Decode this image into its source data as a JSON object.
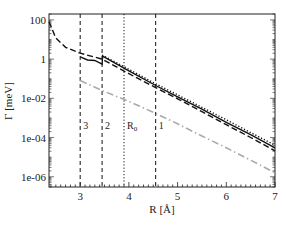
{
  "chart_data": {
    "type": "line",
    "title": "",
    "xlabel": "R [Å]",
    "ylabel": "Γ [meV]",
    "xscale": "linear",
    "yscale": "log",
    "xlim": [
      2.36,
      7.0
    ],
    "ylim": [
      3e-07,
      200
    ],
    "x_ticks": [
      3,
      4,
      5,
      6,
      7
    ],
    "x_tick_labels": [
      "3",
      "4",
      "5",
      "6",
      "7"
    ],
    "y_ticks": [
      100,
      1,
      0.01,
      0.0001,
      1e-06
    ],
    "y_tick_labels": [
      "100",
      "1",
      "1e-02",
      "1e-04",
      "1e-06"
    ],
    "grid": false,
    "legend": null,
    "vertical_markers": [
      {
        "label": "3",
        "x": 3.0,
        "style": "dashed"
      },
      {
        "label": "2",
        "x": 3.45,
        "style": "dashed"
      },
      {
        "label": "R0",
        "label_main": "R",
        "label_sub": "0",
        "x": 3.9,
        "style": "dotted"
      },
      {
        "label": "1",
        "x": 4.55,
        "style": "dashed"
      }
    ],
    "series": [
      {
        "name": "long-dashed (black)",
        "style": "dashed",
        "color": "#111111",
        "x": [
          2.36,
          2.5,
          2.7,
          3.0,
          3.45,
          4.0,
          4.55,
          5.0,
          5.5,
          6.0,
          6.5,
          7.0
        ],
        "y": [
          80,
          12,
          4.0,
          2.0,
          1.0,
          0.18,
          0.035,
          0.0095,
          0.0021,
          0.00045,
          0.0001,
          2.1e-05
        ]
      },
      {
        "name": "solid (black)",
        "style": "solid",
        "color": "#111111",
        "x": [
          3.0,
          3.15,
          3.3,
          3.45,
          3.46,
          4.0,
          4.55,
          5.0,
          5.5,
          6.0,
          6.5,
          7.0
        ],
        "y": [
          1.3,
          0.9,
          0.85,
          0.55,
          1.4,
          0.25,
          0.045,
          0.012,
          0.0028,
          0.0006,
          0.00014,
          3e-05
        ]
      },
      {
        "name": "dotted (black)",
        "style": "dotted",
        "color": "#111111",
        "x": [
          3.45,
          4.0,
          4.55,
          5.0,
          5.5,
          6.0,
          6.5,
          7.0
        ],
        "y": [
          1.6,
          0.3,
          0.055,
          0.015,
          0.0035,
          0.0008,
          0.00018,
          4e-05
        ]
      },
      {
        "name": "dash-dot (gray)",
        "style": "dashdot",
        "color": "#aaaaaa",
        "x": [
          3.0,
          3.45,
          4.0,
          4.55,
          5.0,
          5.5,
          6.0,
          6.5,
          7.0
        ],
        "y": [
          0.08,
          0.025,
          0.007,
          0.0017,
          0.0005,
          0.00012,
          3e-05,
          7e-06,
          1.6e-06
        ]
      }
    ]
  }
}
